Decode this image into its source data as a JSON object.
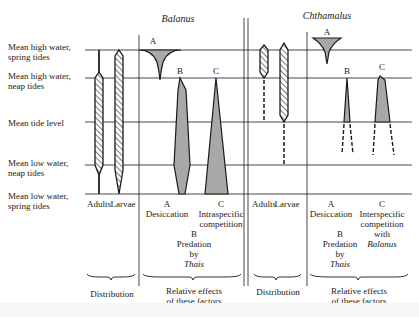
{
  "titles": {
    "left": "Balanus",
    "right": "Chthamalus"
  },
  "tide_levels": [
    {
      "line1": "Mean high water,",
      "line2": "spring tides"
    },
    {
      "line1": "Mean high water,",
      "line2": "neap tides"
    },
    {
      "line1": "Mean tide level",
      "line2": ""
    },
    {
      "line1": "Mean low water,",
      "line2": "neap tides"
    },
    {
      "line1": "Mean low water,",
      "line2": "spring tides"
    }
  ],
  "balanus": {
    "distribution_cols": [
      "Adults",
      "Larvae"
    ],
    "factors": {
      "A": {
        "letter": "A",
        "label": "Desiccation"
      },
      "B": {
        "letter": "B",
        "label1": "Predation",
        "label2": "by",
        "label3": "Thais"
      },
      "C": {
        "letter": "C",
        "label1": "Intraspecific",
        "label2": "competition"
      }
    },
    "group_labels": {
      "distribution": "Distribution",
      "effects1": "Relative effects",
      "effects2": "of these factors"
    }
  },
  "chthamalus": {
    "distribution_cols": [
      "Adults",
      "Larvae"
    ],
    "factors": {
      "A": {
        "letter": "A",
        "label": "Desiccation"
      },
      "B": {
        "letter": "B",
        "label1": "Predation",
        "label2": "by",
        "label3": "Thais"
      },
      "C": {
        "letter": "C",
        "label1": "Interspecific",
        "label2": "competition",
        "label3": "with",
        "label4": "Balanus"
      }
    },
    "group_labels": {
      "distribution": "Distribution",
      "effects1": "Relative effects",
      "effects2": "of these factors"
    }
  },
  "colors": {
    "line": "#1a1a1a",
    "fill": "#a8a8a8",
    "hatch": "#333333",
    "background": "#ffffff"
  }
}
